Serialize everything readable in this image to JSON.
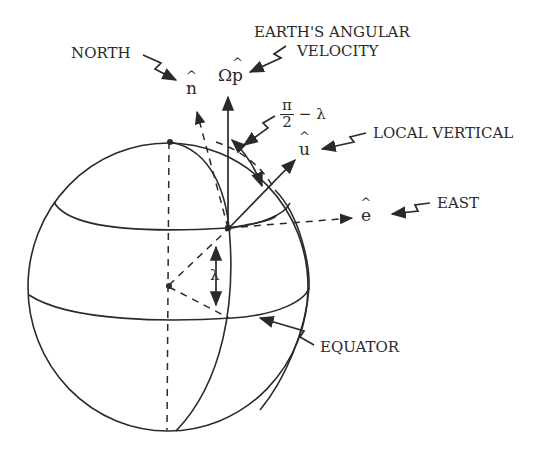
{
  "labels": {
    "north": "NORTH",
    "angular_velocity_line1": "EARTH'S ANGULAR",
    "angular_velocity_line2": "VELOCITY",
    "local_vertical": "LOCAL VERTICAL",
    "east": "EAST",
    "equator": "EQUATOR"
  },
  "symbols": {
    "n_hat": "n",
    "omega": "Ω",
    "p_hat": "p",
    "u_hat": "u",
    "e_hat": "e",
    "lambda": "λ",
    "pi_over_2_num": "π",
    "pi_over_2_den": "2",
    "minus_lambda": "− λ"
  },
  "colors": {
    "line": "#2a2a2a",
    "background": "#ffffff"
  }
}
